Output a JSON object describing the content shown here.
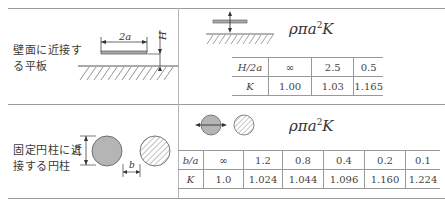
{
  "rows": [
    {
      "label": "壁面に近接する平板",
      "label_lines": [
        "壁面に近接す",
        "る平板"
      ],
      "diagram": {
        "dimension_width": "2a",
        "dimension_height": "H"
      },
      "formula": {
        "base": "ρπa",
        "exp": "2",
        "tail": "K"
      },
      "table": {
        "param_header": "H/2a",
        "param_values": [
          "∞",
          "2.5",
          "0.5"
        ],
        "k_header": "K",
        "k_values": [
          "1.00",
          "1.03",
          "1.165"
        ]
      }
    },
    {
      "label": "固定円柱に近接する円柱",
      "label_lines": [
        "固定円柱に近",
        "接する円柱"
      ],
      "diagram": {
        "dimension_diameter": "2a",
        "dimension_gap": "b"
      },
      "formula": {
        "base": "ρπa",
        "exp": "2",
        "tail": "K"
      },
      "table": {
        "param_header": "b/a",
        "param_values": [
          "∞",
          "1.2",
          "0.8",
          "0.4",
          "0.2",
          "0.1"
        ],
        "k_header": "K",
        "k_values": [
          "1.0",
          "1.024",
          "1.044",
          "1.096",
          "1.160",
          "1.224"
        ]
      }
    }
  ]
}
